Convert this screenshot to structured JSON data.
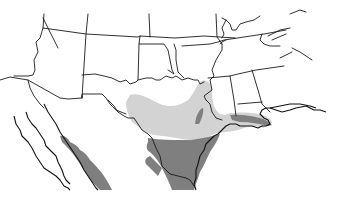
{
  "map": {
    "type": "range-map",
    "region": "Southern United States and Northern Mexico",
    "background_color": "#ffffff",
    "border_color": "#1a1a1a",
    "ranges": [
      {
        "name": "light-range",
        "color": "#d3d3d3"
      },
      {
        "name": "dark-range",
        "color": "#7f7f7f"
      }
    ]
  }
}
